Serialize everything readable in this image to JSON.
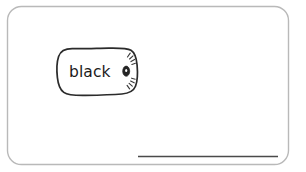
{
  "canvas": {
    "width": 306,
    "height": 172,
    "background_color": "#ffffff"
  },
  "card": {
    "name": "sketch-card",
    "border_color": "#b9b9b9",
    "fill_color": "#ffffff",
    "corner_radius": 14
  },
  "pill_button": {
    "label": "black",
    "stroke_color": "#2b2b2b",
    "fill_color": "#ffffff",
    "text_color": "#1b1b1b",
    "style": "hand-drawn rounded rectangle"
  },
  "pill_icon": {
    "semantic_name": "shine-dot-icon",
    "description": "small dark oval with radiating tick marks",
    "core_color": "#242424",
    "ray_color": "#3a3a3a",
    "ray_count": 8
  },
  "bottom_rule": {
    "semantic_name": "signature-line",
    "color": "#4a4a4a",
    "thickness": 1.7,
    "x_start": 138,
    "x_end": 278,
    "y": 156
  }
}
